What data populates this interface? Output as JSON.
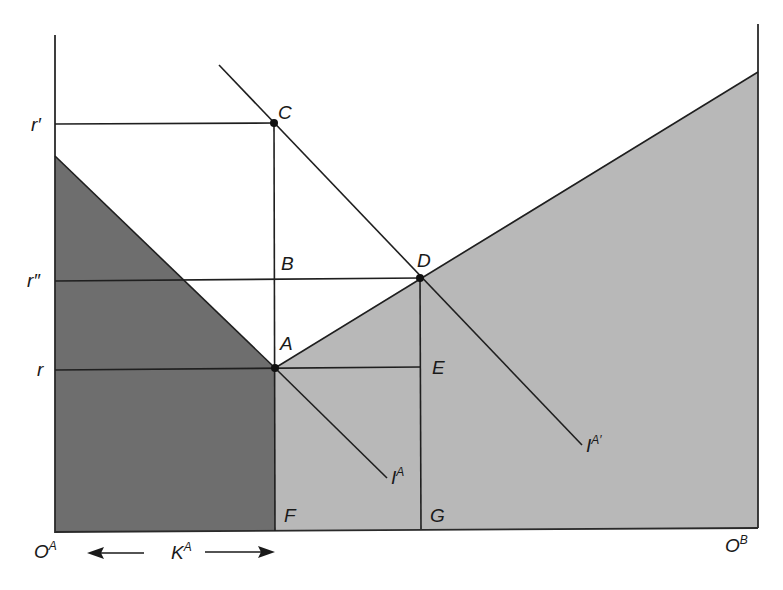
{
  "diagram": {
    "type": "economics-factor-allocation",
    "colors": {
      "background": "#ffffff",
      "dark_region": "#6e6e6e",
      "light_region": "#b8b8b8",
      "lines": "#1f1f1f"
    },
    "axis_labels": {
      "r_prime": "r′",
      "r_double_prime": "r″",
      "r": "r"
    },
    "origins": {
      "left": {
        "base": "O",
        "sup": "A"
      },
      "right": {
        "base": "O",
        "sup": "B"
      }
    },
    "capital_label": {
      "base": "K",
      "sup": "A"
    },
    "points": {
      "A": "A",
      "B": "B",
      "C": "C",
      "D": "D",
      "E": "E",
      "F": "F",
      "G": "G"
    },
    "curves": {
      "IA": {
        "base": "I",
        "sup": "A"
      },
      "IA_prime": {
        "base": "I",
        "sup": "A′"
      }
    }
  }
}
